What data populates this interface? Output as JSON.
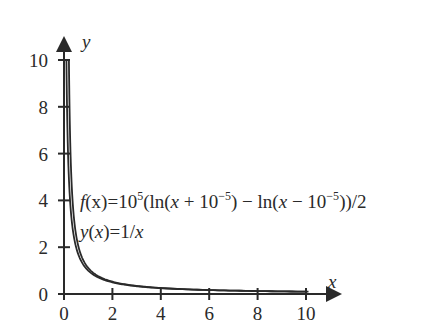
{
  "chart_data": {
    "type": "line",
    "title": "",
    "xlabel": "x",
    "ylabel": "y",
    "xlim": [
      0,
      10
    ],
    "ylim": [
      0,
      10
    ],
    "x_ticks": [
      "0",
      "2",
      "4",
      "6",
      "8",
      "10"
    ],
    "y_ticks": [
      "0",
      "2",
      "4",
      "6",
      "8",
      "10"
    ],
    "grid": false,
    "legend": "none",
    "series": [
      {
        "name": "f(x) = 10^5 (ln(x + 10^-5) - ln(x - 10^-5))/2",
        "x": [
          0.1,
          0.25,
          0.5,
          1,
          2,
          3,
          4,
          6,
          8,
          10
        ],
        "values": [
          10,
          4,
          2,
          1,
          0.5,
          0.333,
          0.25,
          0.167,
          0.125,
          0.1
        ]
      },
      {
        "name": "y(x) = 1/x",
        "x": [
          0.1,
          0.25,
          0.5,
          1,
          2,
          3,
          4,
          6,
          8,
          10
        ],
        "values": [
          10,
          4,
          2,
          1,
          0.5,
          0.333,
          0.25,
          0.167,
          0.125,
          0.1
        ]
      }
    ],
    "annotations": [
      "f(x)=10^5(ln(x+10^-5) - ln(x-10^-5))/2",
      "y(x)=1/x"
    ]
  },
  "labels": {
    "x_axis": "x",
    "y_axis": "y",
    "eq1": {
      "f": "f",
      "x1": "(x)=10",
      "exp1": "5",
      "body": "(ln(",
      "x2": "x",
      "plus": " + 10",
      "exp2": "−5",
      "mid": ") − ln(",
      "x3": "x",
      "minus": " − 10",
      "exp3": "−5",
      "tail": "))/2"
    },
    "eq2": {
      "y": "y",
      "open": "(",
      "x": "x",
      "close": ")=1/",
      "x2": "x"
    }
  }
}
